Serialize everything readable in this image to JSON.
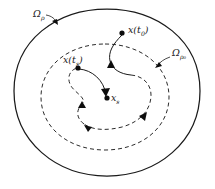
{
  "figure": {
    "background_color": "#ffffff",
    "stroke_color": "#1a1a1a",
    "width": 215,
    "height": 189
  },
  "regions": [
    {
      "id": "outer-region",
      "name": "outer-region-boundary",
      "label_base": "Ω",
      "label_sub": "ρ",
      "label_text": "Ωρ",
      "style": "solid",
      "label_x": 33,
      "label_y": 14
    },
    {
      "id": "inner-region",
      "name": "inner-region-boundary",
      "label_base": "Ω",
      "label_sub": "ρ₀",
      "label_text": "Ωρ₀",
      "style": "dashed",
      "label_x": 172,
      "label_y": 53
    }
  ],
  "points": [
    {
      "id": "x-t0",
      "name": "state-point-x-t0",
      "label_base": "x",
      "label_paren_open": "(",
      "label_var": "t",
      "label_sub": "0",
      "label_paren_close": ")",
      "label_text": "x(t₀)",
      "cx": 122,
      "cy": 33,
      "label_x": 128,
      "label_y": 32
    },
    {
      "id": "x-ts",
      "name": "state-point-x-ts",
      "label_base": "x",
      "label_paren_open": "(",
      "label_var": "t",
      "label_sub": "s",
      "label_paren_close": ")",
      "label_text": "x(tₛ)",
      "cx": 77,
      "cy": 68,
      "label_x": 70,
      "label_y": 63
    },
    {
      "id": "x-s",
      "name": "equilibrium-point-x-s",
      "label_base": "x",
      "label_paren_open": "",
      "label_var": "",
      "label_sub": "s",
      "label_paren_close": "",
      "label_text": "xₛ",
      "cx": 107,
      "cy": 98,
      "label_x": 112,
      "label_y": 101
    }
  ],
  "trajectory": {
    "name": "state-trajectory",
    "description": "spiral trajectory converging to equilibrium",
    "segments": [
      {
        "id": "seg-solid-outer",
        "style": "solid"
      },
      {
        "id": "seg-dashed-loop",
        "style": "dashed"
      },
      {
        "id": "seg-solid-inner",
        "style": "solid"
      }
    ],
    "arrow_count": 4
  }
}
